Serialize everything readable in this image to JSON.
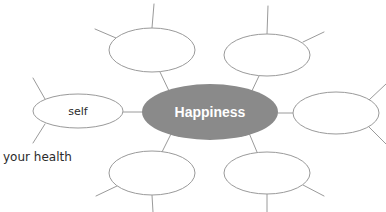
{
  "diagram": {
    "type": "bubble-map",
    "background_color": "#ffffff",
    "outline_color": "#9a9a9a",
    "center_fill_color": "#8a8a8a",
    "center_text_color": "#ffffff",
    "handwriting_text_color": "#2b2b2b",
    "center": {
      "label": "Happiness",
      "cx": 210,
      "cy": 112,
      "rx": 68,
      "ry": 28
    },
    "nodes": [
      {
        "id": "node-top-left",
        "label": "",
        "cx": 152,
        "cy": 50,
        "rx": 43,
        "ry": 22
      },
      {
        "id": "node-top-right",
        "label": "",
        "cx": 267,
        "cy": 55,
        "rx": 43,
        "ry": 21
      },
      {
        "id": "node-left-self",
        "label": "self",
        "cx": 78,
        "cy": 111,
        "rx": 45,
        "ry": 17
      },
      {
        "id": "node-right",
        "label": "",
        "cx": 336,
        "cy": 113,
        "rx": 43,
        "ry": 21
      },
      {
        "id": "node-bottom-left",
        "label": "",
        "cx": 152,
        "cy": 173,
        "rx": 43,
        "ry": 22
      },
      {
        "id": "node-bottom-right",
        "label": "",
        "cx": 267,
        "cy": 173,
        "rx": 43,
        "ry": 21
      }
    ],
    "free_labels": [
      {
        "id": "label-your-health",
        "text": "your health",
        "x": 3,
        "y": 156
      }
    ],
    "spokes": [
      {
        "id": "spoke-top-left-up",
        "x1": 152,
        "y1": 28,
        "x2": 154,
        "y2": 4
      },
      {
        "id": "spoke-top-left-upleft",
        "x1": 116,
        "y1": 38,
        "x2": 95,
        "y2": 29
      },
      {
        "id": "spoke-top-right-up",
        "x1": 267,
        "y1": 34,
        "x2": 268,
        "y2": 6
      },
      {
        "id": "spoke-top-right-upright",
        "x1": 303,
        "y1": 42,
        "x2": 324,
        "y2": 32
      },
      {
        "id": "spoke-self-upleft",
        "x1": 45,
        "y1": 99,
        "x2": 33,
        "y2": 78
      },
      {
        "id": "spoke-self-downleft",
        "x1": 45,
        "y1": 124,
        "x2": 33,
        "y2": 143
      },
      {
        "id": "spoke-right-upright",
        "x1": 369,
        "y1": 100,
        "x2": 384,
        "y2": 86
      },
      {
        "id": "spoke-right-downright",
        "x1": 369,
        "y1": 127,
        "x2": 384,
        "y2": 142
      },
      {
        "id": "spoke-bottom-left-down",
        "x1": 152,
        "y1": 195,
        "x2": 153,
        "y2": 211
      },
      {
        "id": "spoke-bottom-left-downleft",
        "x1": 117,
        "y1": 186,
        "x2": 96,
        "y2": 196
      },
      {
        "id": "spoke-bottom-right-down",
        "x1": 267,
        "y1": 194,
        "x2": 267,
        "y2": 211
      },
      {
        "id": "spoke-bottom-right-downright",
        "x1": 303,
        "y1": 185,
        "x2": 324,
        "y2": 196
      }
    ],
    "connectors": [
      {
        "id": "connector-center-top-left",
        "x1": 170,
        "y1": 93,
        "x2": 160,
        "y2": 72
      },
      {
        "id": "connector-center-top-right",
        "x1": 250,
        "y1": 95,
        "x2": 259,
        "y2": 76
      },
      {
        "id": "connector-center-left-self",
        "x1": 142,
        "y1": 112,
        "x2": 123,
        "y2": 112
      },
      {
        "id": "connector-center-right",
        "x1": 278,
        "y1": 113,
        "x2": 293,
        "y2": 113
      },
      {
        "id": "connector-center-bottom-left",
        "x1": 171,
        "y1": 134,
        "x2": 162,
        "y2": 152
      },
      {
        "id": "connector-center-bottom-right",
        "x1": 249,
        "y1": 133,
        "x2": 257,
        "y2": 152
      }
    ]
  }
}
